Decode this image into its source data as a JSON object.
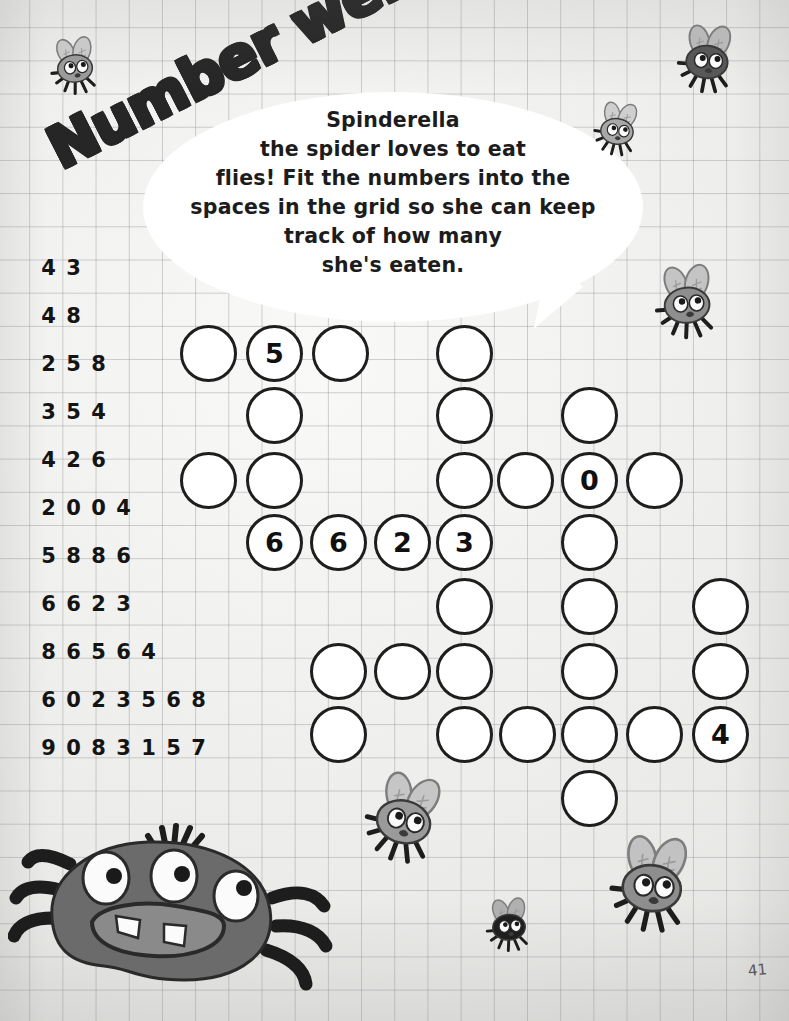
{
  "page": {
    "title": "Number web",
    "page_number": "41",
    "background": "#f2f2f0",
    "grid_line_color": "#8c8c91"
  },
  "bubble": {
    "text": "Spinderella\nthe spider loves to eat\nflies! Fit the numbers into the\nspaces in the grid so she can keep\ntrack of how many\nshe's eaten.",
    "fill": "#ffffff"
  },
  "number_list": {
    "rows": [
      {
        "digits": [
          "4",
          "3"
        ]
      },
      {
        "digits": [
          "4",
          "8"
        ]
      },
      {
        "digits": [
          "2",
          "5",
          "8"
        ]
      },
      {
        "digits": [
          "3",
          "5",
          "4"
        ]
      },
      {
        "digits": [
          "4",
          "2",
          "6"
        ]
      },
      {
        "digits": [
          "2",
          "0",
          "0",
          "4"
        ]
      },
      {
        "digits": [
          "5",
          "8",
          "8",
          "6"
        ]
      },
      {
        "digits": [
          "6",
          "6",
          "2",
          "3"
        ]
      },
      {
        "digits": [
          "8",
          "6",
          "5",
          "6",
          "4"
        ]
      },
      {
        "digits": [
          "6",
          "0",
          "2",
          "3",
          "5",
          "6",
          "8"
        ]
      },
      {
        "digits": [
          "9",
          "0",
          "8",
          "3",
          "1",
          "5",
          "7"
        ]
      }
    ]
  },
  "grid": {
    "cell_size": 57,
    "stroke": "#1e1e1e",
    "fill": "#ffffff",
    "cells": [
      {
        "x": 180,
        "y": 325,
        "value": ""
      },
      {
        "x": 246,
        "y": 325,
        "value": "5"
      },
      {
        "x": 312,
        "y": 325,
        "value": ""
      },
      {
        "x": 436,
        "y": 325,
        "value": ""
      },
      {
        "x": 246,
        "y": 387,
        "value": ""
      },
      {
        "x": 436,
        "y": 387,
        "value": ""
      },
      {
        "x": 561,
        "y": 387,
        "value": ""
      },
      {
        "x": 180,
        "y": 452,
        "value": ""
      },
      {
        "x": 246,
        "y": 452,
        "value": ""
      },
      {
        "x": 436,
        "y": 452,
        "value": ""
      },
      {
        "x": 497,
        "y": 452,
        "value": ""
      },
      {
        "x": 561,
        "y": 452,
        "value": "0"
      },
      {
        "x": 626,
        "y": 452,
        "value": ""
      },
      {
        "x": 246,
        "y": 514,
        "value": "6"
      },
      {
        "x": 310,
        "y": 514,
        "value": "6"
      },
      {
        "x": 374,
        "y": 514,
        "value": "2"
      },
      {
        "x": 436,
        "y": 514,
        "value": "3"
      },
      {
        "x": 561,
        "y": 514,
        "value": ""
      },
      {
        "x": 436,
        "y": 578,
        "value": ""
      },
      {
        "x": 561,
        "y": 578,
        "value": ""
      },
      {
        "x": 692,
        "y": 578,
        "value": ""
      },
      {
        "x": 310,
        "y": 643,
        "value": ""
      },
      {
        "x": 374,
        "y": 643,
        "value": ""
      },
      {
        "x": 436,
        "y": 643,
        "value": ""
      },
      {
        "x": 561,
        "y": 643,
        "value": ""
      },
      {
        "x": 692,
        "y": 643,
        "value": ""
      },
      {
        "x": 310,
        "y": 706,
        "value": ""
      },
      {
        "x": 436,
        "y": 706,
        "value": ""
      },
      {
        "x": 499,
        "y": 706,
        "value": ""
      },
      {
        "x": 561,
        "y": 706,
        "value": ""
      },
      {
        "x": 626,
        "y": 706,
        "value": ""
      },
      {
        "x": 692,
        "y": 706,
        "value": "4"
      },
      {
        "x": 561,
        "y": 770,
        "value": ""
      }
    ]
  },
  "creatures": {
    "spider": {
      "name": "Spinderella",
      "body_color": "#6b6b6b",
      "mouth_color": "#8a8a8a",
      "eye_color": "#ffffff",
      "pupil_color": "#1a1a1a",
      "tooth_color": "#ffffff"
    },
    "flies": [
      {
        "id": "fly-top-left",
        "x": 42,
        "y": 35,
        "w": 66,
        "h": 62,
        "body": "#9b9b9b",
        "wing": "#c9c9c9",
        "scale": 1.0,
        "rot": -6
      },
      {
        "id": "fly-top-right",
        "x": 668,
        "y": 22,
        "w": 78,
        "h": 74,
        "body": "#585858",
        "wing": "#b9b9b9",
        "scale": 1.0,
        "rot": 4
      },
      {
        "id": "fly-bubble-edge",
        "x": 586,
        "y": 100,
        "w": 62,
        "h": 58,
        "body": "#a8a8a8",
        "wing": "#cfcfcf",
        "scale": 1.0,
        "rot": 8
      },
      {
        "id": "fly-right-upper",
        "x": 645,
        "y": 262,
        "w": 84,
        "h": 80,
        "body": "#8e8e8e",
        "wing": "#c4c4c4",
        "scale": 1.0,
        "rot": -4
      },
      {
        "id": "fly-mid-lower",
        "x": 352,
        "y": 770,
        "w": 104,
        "h": 96,
        "body": "#9a9a9a",
        "wing": "#c6c6c6",
        "scale": 1.0,
        "rot": 14
      },
      {
        "id": "fly-bottom-right",
        "x": 596,
        "y": 832,
        "w": 112,
        "h": 104,
        "body": "#8e8e8e",
        "wing": "#c2c2c2",
        "scale": 1.0,
        "rot": 6
      },
      {
        "id": "fly-bottom-small",
        "x": 478,
        "y": 896,
        "w": 62,
        "h": 58,
        "body": "#1f1f1f",
        "wing": "#b0b0b0",
        "scale": 1.0,
        "rot": -4
      }
    ]
  }
}
